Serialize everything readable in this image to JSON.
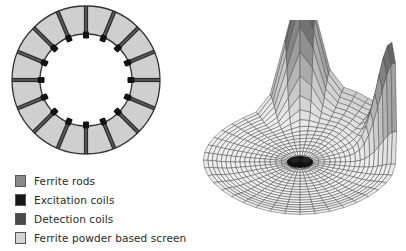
{
  "ring_diagram": {
    "rod_count": 16,
    "center": [
      86,
      80
    ],
    "outer_radius": 74,
    "inner_radius": 46,
    "colors": {
      "screen": "#cfcfcf",
      "rod": "#5a5a5a",
      "coil": "#111111",
      "outline": "#333333"
    }
  },
  "surface_plot": {
    "description": "3D wireframe surface with two peaks and a central dark well",
    "colors": {
      "mesh": "#555555",
      "fill_light": "#eeeeee",
      "fill_dark": "#6a6a6a",
      "well": "#111111"
    }
  },
  "legend": {
    "items": [
      {
        "label": "Ferrite rods",
        "color": "#8a8a8a"
      },
      {
        "label": "Excitation coils",
        "color": "#161616"
      },
      {
        "label": "Detection coils",
        "color": "#4a4a4a"
      },
      {
        "label": "Ferrite powder based screen",
        "color": "#d4d4d4"
      }
    ]
  }
}
